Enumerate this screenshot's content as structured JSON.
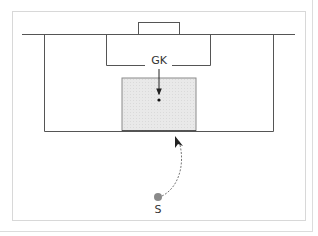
{
  "diagram": {
    "type": "soccer-penalty-area-diagram",
    "labels": {
      "goalkeeper": "GK",
      "shooter": "S"
    },
    "colors": {
      "lines": "#555555",
      "shaded_zone": "#e6e6e6",
      "ball": "#888888",
      "arrow": "#222222",
      "dashed_path": "#777777"
    },
    "elements": [
      {
        "name": "goal",
        "shape": "rect"
      },
      {
        "name": "goal-area",
        "shape": "rect"
      },
      {
        "name": "penalty-area",
        "shape": "rect"
      },
      {
        "name": "goal-line",
        "shape": "line"
      },
      {
        "name": "shaded-target-zone",
        "shape": "rect"
      },
      {
        "name": "goalkeeper-movement-arrow",
        "shape": "arrow"
      },
      {
        "name": "goalkeeper-position-dot",
        "shape": "dot"
      },
      {
        "name": "shooter-ball",
        "shape": "dot"
      },
      {
        "name": "curved-shot-path",
        "shape": "dashed-curve-arrow"
      }
    ]
  }
}
